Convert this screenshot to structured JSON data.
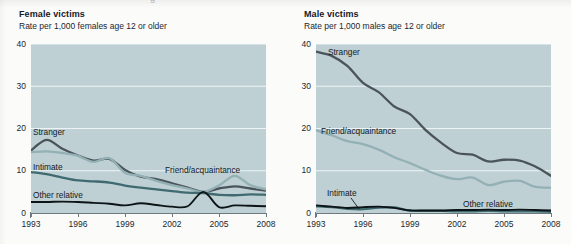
{
  "page": {
    "clipped_header_fragment": "g",
    "background_color": "#fbfbfa"
  },
  "colors": {
    "plot_background": "#bed0d4",
    "gridline": "#eef4f5",
    "axis": "#6d7a80",
    "stranger": "#4a545a",
    "friend_acquaintance": "#93b0b5",
    "intimate": "#3f6a70",
    "other_relative": "#0d1417"
  },
  "panels": [
    {
      "id": "female",
      "title": "Female victims",
      "subtitle": "Rate per 1,000 females age 12 or older",
      "series_labels": [
        {
          "name": "stranger-label",
          "text": "Stranger",
          "x": 33,
          "y": 128
        },
        {
          "name": "intimate-label",
          "text": "Intimate",
          "x": 33,
          "y": 163
        },
        {
          "name": "other-relative-label",
          "text": "Other relative",
          "x": 33,
          "y": 191
        },
        {
          "name": "friend-acquaintance-label",
          "text": "Friend/acquaintance",
          "x": 165,
          "y": 166
        }
      ],
      "chart_data": {
        "type": "line",
        "title": "Female victims",
        "subtitle": "Rate per 1,000 females age 12 or older",
        "xlabel": "",
        "ylabel": "Rate per 1,000 females age 12 or older",
        "x": [
          1993,
          1994,
          1995,
          1996,
          1997,
          1998,
          1999,
          2000,
          2001,
          2002,
          2003,
          2004,
          2005,
          2006,
          2007,
          2008
        ],
        "xlim": [
          1993,
          2008
        ],
        "ylim": [
          0,
          40
        ],
        "yticks": [
          0,
          10,
          20,
          30,
          40
        ],
        "xticks": [
          1993,
          1996,
          1999,
          2002,
          2005,
          2008
        ],
        "grid": true,
        "legend": "inline-labels",
        "series": [
          {
            "name": "Stranger",
            "color": "#4a545a",
            "values": [
              14.8,
              17.3,
              15.2,
              13.6,
              12.4,
              12.8,
              10.2,
              8.6,
              8.0,
              7.0,
              6.0,
              5.0,
              5.8,
              6.3,
              5.8,
              5.3
            ]
          },
          {
            "name": "Friend/acquaintance",
            "color": "#93b0b5",
            "values": [
              14.4,
              14.6,
              14.2,
              13.5,
              12.1,
              13.0,
              9.5,
              8.8,
              7.6,
              6.6,
              5.8,
              5.0,
              6.5,
              8.8,
              6.6,
              5.6
            ]
          },
          {
            "name": "Intimate",
            "color": "#3f6a70",
            "values": [
              9.7,
              9.2,
              8.4,
              7.7,
              7.5,
              7.2,
              6.5,
              6.0,
              5.6,
              5.2,
              4.8,
              4.7,
              4.3,
              4.2,
              4.4,
              4.3
            ]
          },
          {
            "name": "Other relative",
            "color": "#0d1417",
            "values": [
              2.6,
              2.6,
              2.7,
              2.6,
              2.4,
              2.2,
              1.8,
              2.3,
              1.9,
              1.5,
              1.6,
              5.0,
              1.4,
              1.8,
              1.7,
              1.6
            ]
          }
        ]
      }
    },
    {
      "id": "male",
      "title": "Male victims",
      "subtitle": "Rate per 1,000 males age 12 or older",
      "series_labels": [
        {
          "name": "stranger-label",
          "text": "Stranger",
          "x": 43,
          "y": 48
        },
        {
          "name": "friend-acquaintance-label",
          "text": "Friend/acquaintance",
          "x": 36,
          "y": 127
        },
        {
          "name": "intimate-label",
          "text": "Intimate",
          "x": 42,
          "y": 189
        },
        {
          "name": "other-relative-label",
          "text": "Other relative",
          "x": 178,
          "y": 200
        }
      ],
      "chart_data": {
        "type": "line",
        "title": "Male victims",
        "subtitle": "Rate per 1,000 males age 12 or older",
        "xlabel": "",
        "ylabel": "Rate per 1,000 males age 12 or older",
        "x": [
          1993,
          1994,
          1995,
          1996,
          1997,
          1998,
          1999,
          2000,
          2001,
          2002,
          2003,
          2004,
          2005,
          2006,
          2007,
          2008
        ],
        "xlim": [
          1993,
          2008
        ],
        "ylim": [
          0,
          40
        ],
        "yticks": [
          0,
          10,
          20,
          30,
          40
        ],
        "xticks": [
          1993,
          1996,
          1999,
          2002,
          2005,
          2008
        ],
        "grid": true,
        "legend": "inline-labels",
        "series": [
          {
            "name": "Stranger",
            "color": "#4a545a",
            "values": [
              38.2,
              37.2,
              34.8,
              30.8,
              28.6,
              25.2,
              23.4,
              19.6,
              16.6,
              14.2,
              13.8,
              12.2,
              12.6,
              12.4,
              11.0,
              8.8
            ]
          },
          {
            "name": "Friend/acquaintance",
            "color": "#93b0b5",
            "values": [
              19.6,
              18.4,
              17.0,
              16.3,
              15.0,
              13.2,
              11.8,
              10.2,
              8.8,
              8.0,
              8.4,
              6.6,
              7.4,
              7.6,
              6.2,
              6.0
            ]
          },
          {
            "name": "Intimate",
            "color": "#3f6a70",
            "values": [
              1.6,
              1.4,
              1.0,
              0.9,
              1.3,
              1.3,
              0.6,
              0.5,
              0.5,
              0.4,
              0.4,
              0.5,
              0.4,
              0.4,
              0.4,
              0.3
            ]
          },
          {
            "name": "Other relative",
            "color": "#0d1417",
            "values": [
              1.8,
              1.5,
              1.2,
              1.4,
              1.5,
              1.2,
              0.6,
              0.6,
              0.6,
              0.7,
              0.7,
              0.8,
              0.7,
              0.8,
              0.7,
              0.6
            ]
          }
        ]
      }
    }
  ]
}
